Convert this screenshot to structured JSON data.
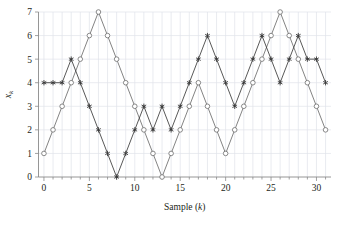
{
  "chart_data": {
    "type": "line",
    "title": "",
    "xlabel": "Sample (k)",
    "ylabel": "x_k",
    "xlim": [
      -0.6,
      31.6
    ],
    "ylim": [
      0,
      7
    ],
    "xticks": [
      0,
      5,
      10,
      15,
      20,
      25,
      30
    ],
    "yticks": [
      0,
      1,
      2,
      3,
      4,
      5,
      6,
      7
    ],
    "xtick_labels": [
      "0",
      "5",
      "10",
      "15",
      "20",
      "25",
      "30"
    ],
    "ytick_labels": [
      "0",
      "1",
      "2",
      "3",
      "4",
      "5",
      "6",
      "7"
    ],
    "grid": true,
    "legend": "none",
    "x": [
      0,
      1,
      2,
      3,
      4,
      5,
      6,
      7,
      8,
      9,
      10,
      11,
      12,
      13,
      14,
      15,
      16,
      17,
      18,
      19,
      20,
      21,
      22,
      23,
      24,
      25,
      26,
      27,
      28,
      29,
      30,
      31
    ],
    "series": [
      {
        "name": "circle-series",
        "marker": "open-circle",
        "color": "#6d6d6d",
        "values": [
          1,
          2,
          3,
          4,
          5,
          6,
          7,
          6,
          5,
          4,
          3,
          2,
          1,
          0,
          1,
          2,
          3,
          4,
          3,
          2,
          1,
          2,
          3,
          4,
          5,
          6,
          7,
          6,
          5,
          4,
          3,
          2
        ]
      },
      {
        "name": "star-series",
        "marker": "filled-star",
        "color": "#3a3a3a",
        "values": [
          4,
          4,
          4,
          5,
          4,
          3,
          2,
          1,
          0,
          1,
          2,
          3,
          2,
          3,
          2,
          3,
          4,
          5,
          6,
          5,
          4,
          3,
          4,
          5,
          6,
          5,
          4,
          5,
          6,
          5,
          5,
          4
        ]
      }
    ]
  },
  "axes": {
    "x_label_text": "Sample (",
    "x_label_var": "k",
    "x_label_close": ")",
    "y_label_var": "x",
    "y_label_sub": "k"
  },
  "colors": {
    "grid": "#dfe3ea",
    "axis": "#8a8a8a",
    "circle_line": "#6d6d6d",
    "star_line": "#4a4a4a",
    "background": "#ffffff"
  }
}
